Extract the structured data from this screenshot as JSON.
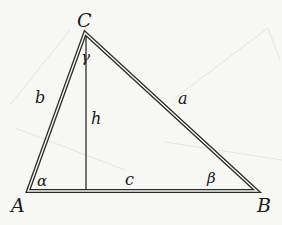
{
  "diagram": {
    "type": "triangle",
    "vertices": {
      "A": {
        "label": "A",
        "x": 28,
        "y": 191
      },
      "B": {
        "label": "B",
        "x": 257,
        "y": 191
      },
      "C": {
        "label": "C",
        "x": 85,
        "y": 33
      }
    },
    "sides": {
      "a": {
        "label": "a",
        "from": "B",
        "to": "C"
      },
      "b": {
        "label": "b",
        "from": "A",
        "to": "C"
      },
      "c": {
        "label": "c",
        "from": "A",
        "to": "B"
      }
    },
    "angles": {
      "alpha": {
        "label": "α",
        "at": "A"
      },
      "beta": {
        "label": "β",
        "at": "B"
      },
      "gamma": {
        "label": "γ",
        "at": "C"
      }
    },
    "altitude": {
      "label": "h",
      "from": "C",
      "foot_x": 86,
      "foot_y": 191
    },
    "colors": {
      "line": "#2a2a2a",
      "background": "#f7f7f5",
      "ghost": "#e6e6e4"
    }
  }
}
